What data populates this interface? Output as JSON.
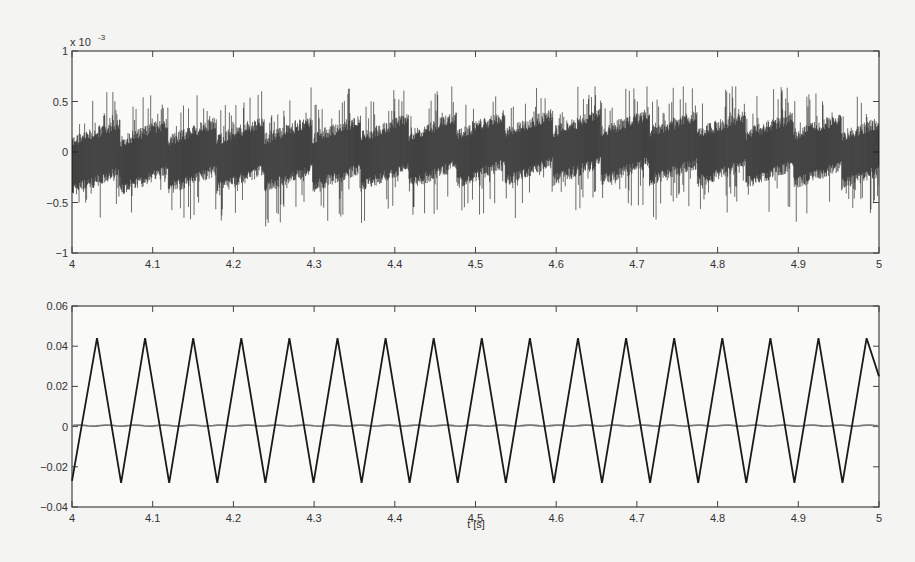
{
  "chart_data": [
    {
      "type": "line",
      "panel": "top",
      "title": "",
      "xlabel": "",
      "ylabel": "",
      "y_scale_annotation": "x 10^-3",
      "xlim": [
        4,
        5
      ],
      "ylim": [
        -1,
        1
      ],
      "x_ticks": [
        4,
        4.1,
        4.2,
        4.3,
        4.4,
        4.5,
        4.6,
        4.7,
        4.8,
        4.9,
        5
      ],
      "x_tick_labels": [
        "4",
        "4.1",
        "4.2",
        "4.3",
        "4.4",
        "4.5",
        "4.6",
        "4.7",
        "4.8",
        "4.9",
        "5"
      ],
      "y_ticks": [
        -1,
        -0.5,
        0,
        0.5,
        1
      ],
      "y_tick_labels": [
        "-1",
        "-0.5",
        "0",
        "0.5",
        "1"
      ],
      "grid": false,
      "series": [
        {
          "name": "signal (x10^-3)",
          "color": "#1a1a1a",
          "description": "dense high-frequency noise band approx ±0.3e-3 about a slowly varying center with sawtooth-like drift; spikes up to about ±0.6 to ±0.8e-3",
          "center_trend": {
            "x": [
              4.0,
              4.2,
              4.4,
              4.6,
              4.7,
              4.8,
              5.0
            ],
            "y": [
              -0.05,
              -0.03,
              0.0,
              0.05,
              0.05,
              0.03,
              0.0
            ]
          },
          "band_halfwidth": 0.3,
          "spike_extent": [
            -0.8,
            0.65
          ]
        }
      ]
    },
    {
      "type": "line",
      "panel": "bottom",
      "title": "",
      "xlabel": "t [s]",
      "ylabel": "",
      "xlim": [
        4,
        5
      ],
      "ylim": [
        -0.04,
        0.06
      ],
      "x_ticks": [
        4,
        4.1,
        4.2,
        4.3,
        4.4,
        4.5,
        4.6,
        4.7,
        4.8,
        4.9,
        5
      ],
      "x_tick_labels": [
        "4",
        "4.1",
        "4.2",
        "4.3",
        "4.4",
        "4.5",
        "4.6",
        "4.7",
        "4.8",
        "4.9",
        "5"
      ],
      "y_ticks": [
        -0.04,
        -0.02,
        0,
        0.02,
        0.04,
        0.06
      ],
      "y_tick_labels": [
        "-0.04",
        "-0.02",
        "0",
        "0.02",
        "0.04",
        "0.06"
      ],
      "grid": false,
      "series": [
        {
          "name": "triangle wave",
          "color": "#1a1a1a",
          "shape": "triangle",
          "start": {
            "x": 4.0,
            "y": -0.027
          },
          "peak_value": 0.044,
          "trough_value": -0.028,
          "period": 0.0596,
          "first_peak_x": 4.031,
          "end": {
            "x": 5.0,
            "y": 0.025
          }
        },
        {
          "name": "near-zero signal",
          "color": "#777777",
          "shape": "flat",
          "value": 0.0005,
          "ripple": 0.0008
        }
      ]
    }
  ],
  "labels": {
    "top_scale": "x 10",
    "top_scale_exp": "-3",
    "bottom_xlabel": "t [s]"
  }
}
